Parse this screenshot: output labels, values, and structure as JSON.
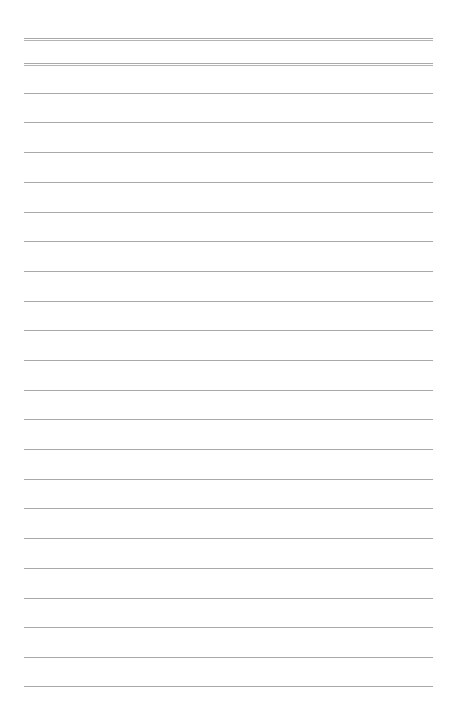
{
  "page": {
    "type": "lined-paper",
    "line_color": "#a9a9a9",
    "background": "#ffffff",
    "header_rules": [
      {
        "y": 38,
        "style": "double"
      },
      {
        "y": 63,
        "style": "double"
      }
    ],
    "writing_lines": [
      {
        "y": 93,
        "text": ""
      },
      {
        "y": 122,
        "text": ""
      },
      {
        "y": 152,
        "text": ""
      },
      {
        "y": 182,
        "text": ""
      },
      {
        "y": 212,
        "text": ""
      },
      {
        "y": 241,
        "text": ""
      },
      {
        "y": 271,
        "text": ""
      },
      {
        "y": 301,
        "text": ""
      },
      {
        "y": 330,
        "text": ""
      },
      {
        "y": 360,
        "text": ""
      },
      {
        "y": 390,
        "text": ""
      },
      {
        "y": 419,
        "text": ""
      },
      {
        "y": 449,
        "text": ""
      },
      {
        "y": 479,
        "text": ""
      },
      {
        "y": 508,
        "text": ""
      },
      {
        "y": 538,
        "text": ""
      },
      {
        "y": 568,
        "text": ""
      },
      {
        "y": 598,
        "text": ""
      },
      {
        "y": 627,
        "text": ""
      },
      {
        "y": 657,
        "text": ""
      },
      {
        "y": 686,
        "text": ""
      }
    ]
  }
}
